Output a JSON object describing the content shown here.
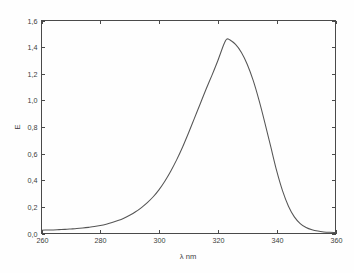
{
  "chart_data": {
    "type": "line",
    "title": "",
    "subtitle": "",
    "xlabel": "λ nm",
    "ylabel": "E",
    "xlim": [
      260,
      360
    ],
    "ylim": [
      0.0,
      1.6
    ],
    "grid": false,
    "legend": null,
    "legend_position": "none",
    "decimal_separator": ",",
    "line_color": "#555555",
    "frame_color": "#4a4a4a",
    "background_color": "#fefefe",
    "xticks": [
      260,
      280,
      300,
      320,
      340,
      360
    ],
    "xticklabels": [
      "260",
      "280",
      "300",
      "320",
      "340",
      "360"
    ],
    "yticks": [
      0.0,
      0.2,
      0.4,
      0.6,
      0.8,
      1.0,
      1.2,
      1.4,
      1.6
    ],
    "yticklabels": [
      "0,0",
      "0,2",
      "0,4",
      "0,6",
      "0,8",
      "1,0",
      "1,2",
      "1,4",
      "1,6"
    ],
    "peak": {
      "x": 323,
      "y": 1.46
    },
    "series": [
      {
        "name": "absorption spectrum",
        "color": "#555555",
        "x": [
          260,
          262,
          264,
          266,
          268,
          270,
          272,
          274,
          276,
          278,
          280,
          282,
          284,
          286,
          288,
          290,
          292,
          294,
          296,
          298,
          300,
          302,
          304,
          306,
          308,
          310,
          312,
          314,
          316,
          318,
          320,
          322,
          323,
          324,
          326,
          328,
          330,
          332,
          334,
          336,
          338,
          340,
          342,
          344,
          346,
          348,
          350,
          352,
          354,
          356,
          358,
          360
        ],
        "values": [
          0.025,
          0.026,
          0.027,
          0.029,
          0.031,
          0.034,
          0.037,
          0.041,
          0.046,
          0.052,
          0.06,
          0.07,
          0.082,
          0.097,
          0.115,
          0.137,
          0.163,
          0.195,
          0.232,
          0.276,
          0.33,
          0.395,
          0.47,
          0.555,
          0.65,
          0.755,
          0.865,
          0.975,
          1.085,
          1.19,
          1.3,
          1.42,
          1.46,
          1.455,
          1.42,
          1.36,
          1.27,
          1.15,
          1.0,
          0.83,
          0.65,
          0.47,
          0.32,
          0.205,
          0.125,
          0.075,
          0.045,
          0.028,
          0.018,
          0.012,
          0.009,
          0.008
        ]
      }
    ]
  },
  "figure": {
    "name": "uv-vis-absorption-spectrum"
  }
}
